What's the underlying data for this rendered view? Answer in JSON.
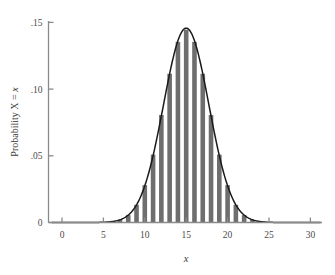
{
  "chart_data": {
    "type": "bar",
    "title": "",
    "subtitle": "",
    "xlabel": "x",
    "ylabel": "Probability X = x",
    "xlim": [
      -1.2,
      31.2
    ],
    "ylim": [
      0,
      0.158
    ],
    "grid": false,
    "legend": null,
    "xticks": [
      0,
      5,
      10,
      15,
      20,
      25,
      30
    ],
    "xtick_labels": [
      "0",
      "5",
      "10",
      "15",
      "20",
      "25",
      "30"
    ],
    "yticks": [
      0,
      0.05,
      0.1,
      0.15
    ],
    "ytick_labels": [
      "0",
      ".05",
      ".10",
      ".15"
    ],
    "bar_color": "#6e6e6e",
    "curve_color": "#1a1a1a",
    "axis_color": "#8a8a8a",
    "distribution": "binomial n=30 p=0.5 with normal approximation curve",
    "categories": [
      0,
      1,
      2,
      3,
      4,
      5,
      6,
      7,
      8,
      9,
      10,
      11,
      12,
      13,
      14,
      15,
      16,
      17,
      18,
      19,
      20,
      21,
      22,
      23,
      24,
      25,
      26,
      27,
      28,
      29,
      30
    ],
    "values": [
      0.0,
      0.0,
      0.0,
      0.0,
      0.0,
      0.0001,
      0.0006,
      0.0019,
      0.0055,
      0.0133,
      0.028,
      0.0509,
      0.0806,
      0.1115,
      0.1354,
      0.1445,
      0.1354,
      0.1115,
      0.0806,
      0.0509,
      0.028,
      0.0133,
      0.0055,
      0.0019,
      0.0006,
      0.0001,
      0.0,
      0.0,
      0.0,
      0.0,
      0.0
    ],
    "series": [
      {
        "name": "Normal approximation",
        "type": "line",
        "mean": 15,
        "sigma": 2.7386,
        "peak": 0.1457
      }
    ]
  },
  "axes": {
    "y_axis_label": "Probability X = x",
    "y_axis_label_static": "Probability X = ",
    "y_axis_label_var": "x",
    "x_axis_label": "x"
  }
}
